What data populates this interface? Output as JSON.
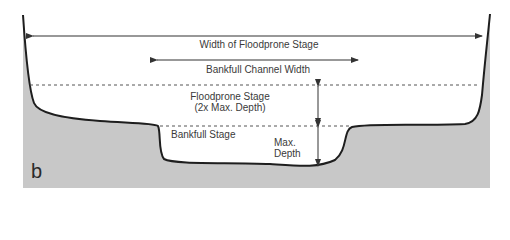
{
  "panel_label": "b",
  "labels": {
    "floodprone_width": "Width of Floodprone Stage",
    "bankfull_width": "Bankfull Channel Width",
    "floodprone_stage_line1": "Floodprone Stage",
    "floodprone_stage_line2": "(2x Max. Depth)",
    "bankfull_stage": "Bankfull Stage",
    "max_depth_line1": "Max.",
    "max_depth_line2": "Depth"
  },
  "colors": {
    "ground_fill": "#c8c8c8",
    "outline": "#1e1e1e",
    "arrow": "#333333",
    "dotted": "#555555",
    "text": "#3a3a3a"
  }
}
